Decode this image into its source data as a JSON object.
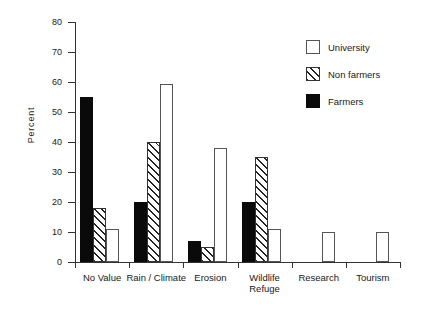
{
  "chart_data": {
    "type": "bar",
    "title": "",
    "subtitle": "",
    "xlabel": "",
    "ylabel": "Percent",
    "ylim": [
      0,
      80
    ],
    "ytick_step": 10,
    "yticks": [
      0,
      10,
      20,
      30,
      40,
      50,
      60,
      70,
      80
    ],
    "ytick_labels": [
      "0",
      "10",
      "20",
      "30",
      "40",
      "50",
      "60",
      "70",
      "80"
    ],
    "grid": false,
    "legend_position": "upper right",
    "categories": [
      "No Value",
      "Rain / Climate",
      "Erosion",
      "Wildlife\nRefuge",
      "Research",
      "Tourism"
    ],
    "series": [
      {
        "name": "Farmers",
        "fill": "solid-black",
        "color": "#0a0a0a",
        "values": [
          55,
          20,
          7,
          20,
          0,
          0
        ]
      },
      {
        "name": "Non farmers",
        "fill": "diagonal-hatch",
        "color": "#ffffff",
        "values": [
          18,
          40,
          5,
          35,
          0,
          0
        ]
      },
      {
        "name": "University",
        "fill": "open-white",
        "color": "#ffffff",
        "values": [
          11,
          59.5,
          38,
          11,
          10,
          10
        ]
      }
    ],
    "legend_entries": [
      {
        "label": "University",
        "swatch": "open-white"
      },
      {
        "label": "Non farmers",
        "swatch": "diagonal-hatch"
      },
      {
        "label": "Farmers",
        "swatch": "solid-black"
      }
    ]
  }
}
